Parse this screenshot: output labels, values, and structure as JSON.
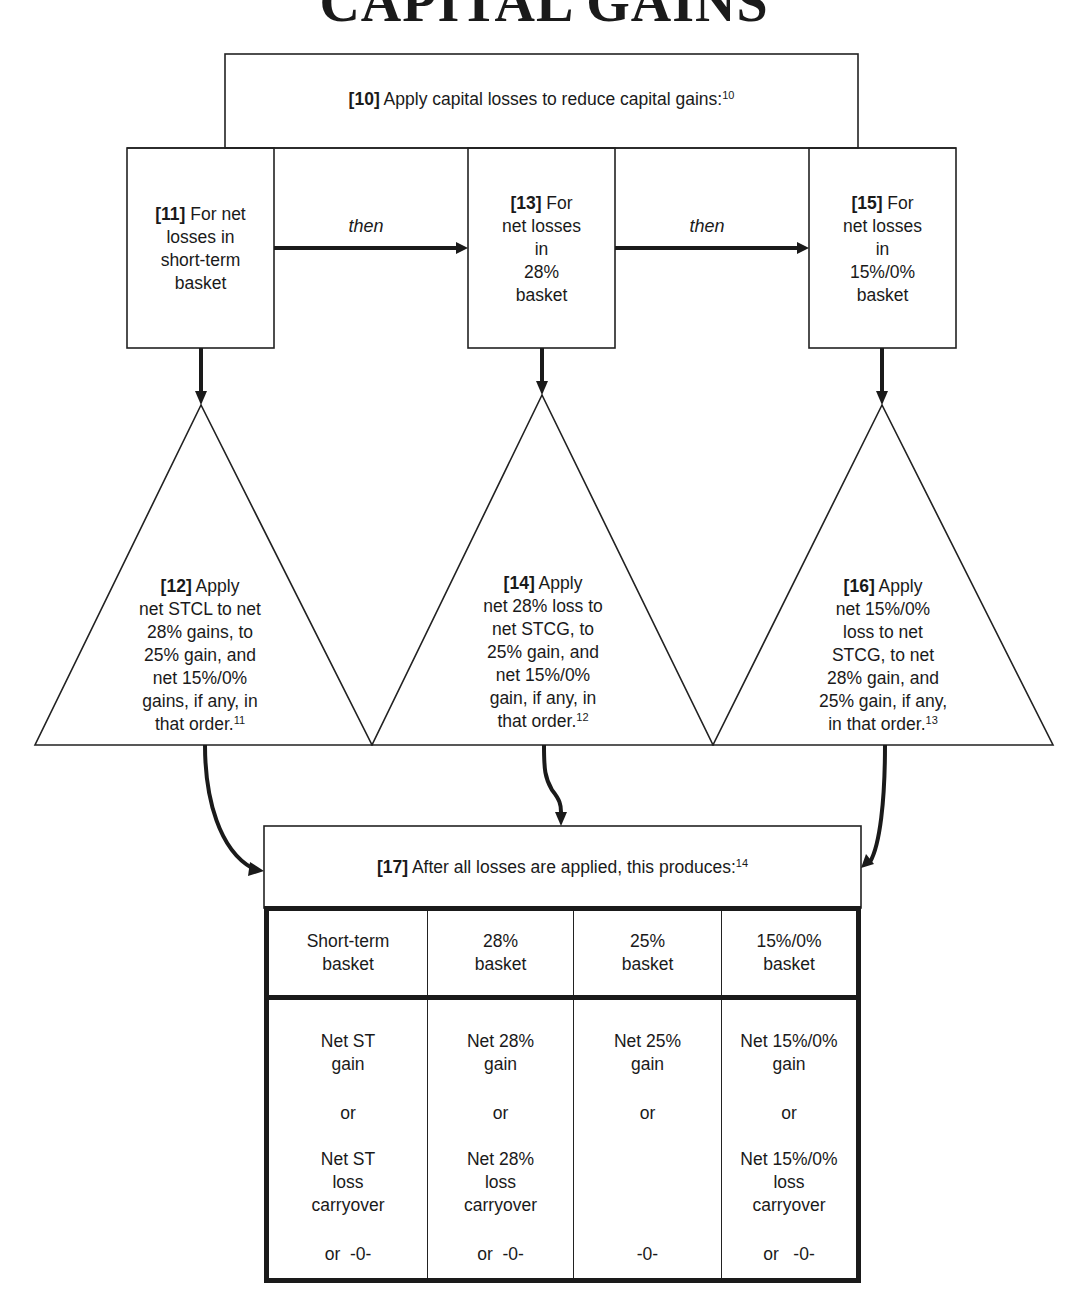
{
  "title": "CAPITAL GAINS",
  "step10": {
    "num": "[10]",
    "text": " Apply capital losses to reduce capital gains:",
    "footnote": "10"
  },
  "step11": {
    "num": "[11]",
    "line1": " For net",
    "line2": "losses in",
    "line3": "short-term",
    "line4": "basket"
  },
  "step13": {
    "num": "[13]",
    "line1": " For",
    "line2": "net losses",
    "line3": "in",
    "line4": "28%",
    "line5": "basket"
  },
  "step15": {
    "num": "[15]",
    "line1": " For",
    "line2": "net losses",
    "line3": "in",
    "line4": "15%/0%",
    "line5": "basket"
  },
  "connector_then": "then",
  "step12": {
    "num": "[12]",
    "lines": [
      " Apply",
      "net STCL to net",
      "28% gains, to",
      "25% gain, and",
      "net 15%/0%",
      "gains, if any, in",
      "that order."
    ],
    "footnote": "11"
  },
  "step14": {
    "num": "[14]",
    "lines": [
      " Apply",
      "net 28% loss to",
      "net STCG, to",
      "25% gain, and",
      "net 15%/0%",
      "gain, if any, in",
      "that order."
    ],
    "footnote": "12"
  },
  "step16": {
    "num": "[16]",
    "lines": [
      " Apply",
      "net 15%/0%",
      "loss to net",
      "STCG, to net",
      "28% gain, and",
      "25% gain, if any,",
      "in that order."
    ],
    "footnote": "13"
  },
  "step17": {
    "num": "[17]",
    "text": " After all losses are applied, this produces:",
    "footnote": "14"
  },
  "result_table": {
    "headers": [
      {
        "l1": "Short-term",
        "l2": "basket"
      },
      {
        "l1": "28%",
        "l2": "basket"
      },
      {
        "l1": "25%",
        "l2": "basket"
      },
      {
        "l1": "15%/0%",
        "l2": "basket"
      }
    ],
    "columns": [
      {
        "gain1": "Net ST",
        "gain2": "gain",
        "or1": "or",
        "loss1": "Net ST",
        "loss2": "loss",
        "loss3": "carryover",
        "zero": "or  -0-"
      },
      {
        "gain1": "Net 28%",
        "gain2": "gain",
        "or1": "or",
        "loss1": "Net 28%",
        "loss2": "loss",
        "loss3": "carryover",
        "zero": "or  -0-"
      },
      {
        "gain1": "Net 25%",
        "gain2": "gain",
        "or1": "or",
        "loss1": "",
        "loss2": "",
        "loss3": "",
        "zero": "-0-"
      },
      {
        "gain1": "Net 15%/0%",
        "gain2": "gain",
        "or1": "or",
        "loss1": "Net 15%/0%",
        "loss2": "loss",
        "loss3": "carryover",
        "zero": "or   -0-"
      }
    ]
  }
}
